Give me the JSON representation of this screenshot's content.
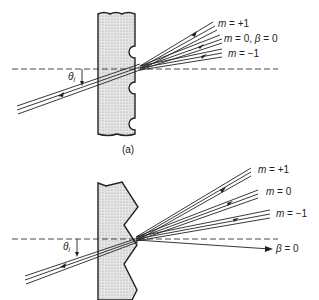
{
  "figure": {
    "panel_a": {
      "caption": "(a)",
      "grating_type": "sinusoidal-notch grating",
      "incident_angle_label": "θ",
      "incident_angle_subscript": "i",
      "orders": [
        {
          "label_var": "m",
          "label_rest": " = +1"
        },
        {
          "label_var": "m",
          "label_rest": " = 0, ",
          "label_extra_var": "β",
          "label_extra_rest": " = 0"
        },
        {
          "label_var": "m",
          "label_rest": " = −1"
        }
      ]
    },
    "panel_b": {
      "grating_type": "blazed sawtooth grating",
      "incident_angle_label": "θ",
      "incident_angle_subscript": "i",
      "orders": [
        {
          "label_var": "m",
          "label_rest": " = +1"
        },
        {
          "label_var": "m",
          "label_rest": " = 0"
        },
        {
          "label_var": "m",
          "label_rest": " = −1"
        }
      ],
      "normal_label_var": "β",
      "normal_label_rest": " = 0"
    },
    "colors": {
      "line": "#222222",
      "fill": "#d9d9d9"
    }
  }
}
